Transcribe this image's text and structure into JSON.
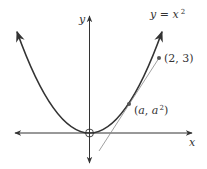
{
  "diagram": {
    "curve_label": {
      "lhs": "y",
      "eq": " = ",
      "base": "x",
      "exp": "2"
    },
    "axes": {
      "x_label": "x",
      "y_label": "y"
    },
    "points": [
      {
        "label_open": "(",
        "label_a": "2, 3",
        "label_close": ")",
        "name": "external-point"
      },
      {
        "label_open": "(",
        "label_a": "a",
        "label_comma": ", ",
        "label_b": "a",
        "label_exp": "2",
        "label_close": ")",
        "name": "tangent-point"
      }
    ],
    "colors": {
      "curve": "#333333",
      "axis": "#333333",
      "tangent": "#888888",
      "point": "#555555"
    }
  }
}
